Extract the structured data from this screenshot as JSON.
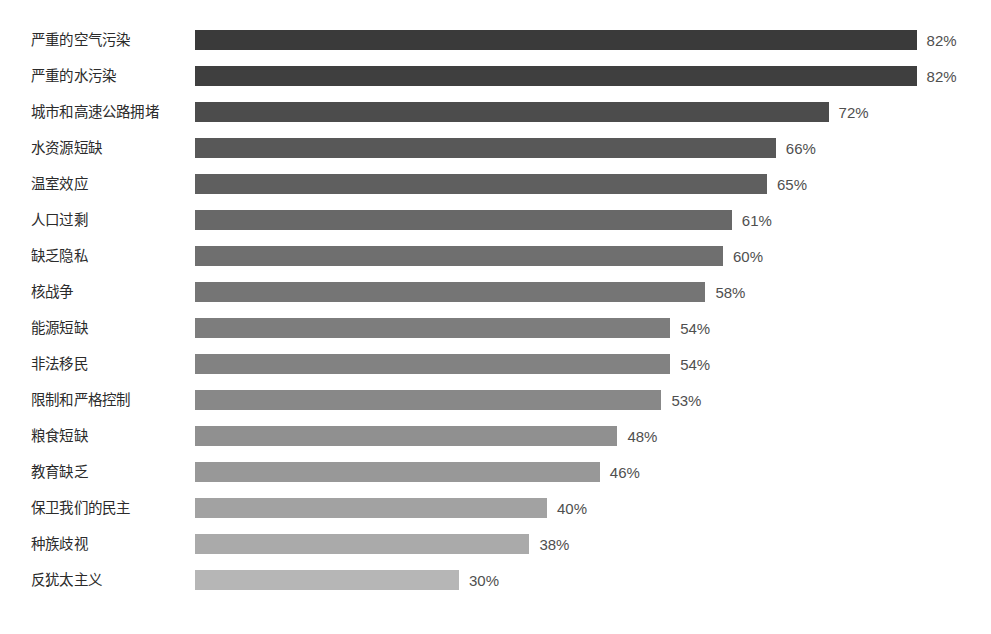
{
  "chart_data": {
    "type": "bar",
    "orientation": "horizontal",
    "title": "",
    "subtitle": "",
    "xlabel": "",
    "ylabel": "",
    "xlim": [
      0,
      90
    ],
    "grid": false,
    "legend": null,
    "value_suffix": "%",
    "categories": [
      "严重的空气污染",
      "严重的水污染",
      "城市和高速公路拥堵",
      "水资源短缺",
      "温室效应",
      "人口过剩",
      "缺乏隐私",
      "核战争",
      "能源短缺",
      "非法移民",
      "限制和严格控制",
      "粮食短缺",
      "教育缺乏",
      "保卫我们的民主",
      "种族歧视",
      "反犹太主义"
    ],
    "values": [
      82,
      82,
      72,
      66,
      65,
      61,
      60,
      58,
      54,
      54,
      53,
      48,
      46,
      40,
      38,
      30
    ],
    "value_labels": [
      "82%",
      "82%",
      "72%",
      "66%",
      "65%",
      "61%",
      "60%",
      "58%",
      "54%",
      "54%",
      "53%",
      "48%",
      "46%",
      "40%",
      "38%",
      "30%"
    ],
    "bar_colors": [
      "#3a3a3a",
      "#3f3f3f",
      "#4c4c4c",
      "#585858",
      "#5f5f5f",
      "#686868",
      "#6f6f6f",
      "#757575",
      "#7d7d7d",
      "#828282",
      "#888888",
      "#909090",
      "#989898",
      "#a2a2a2",
      "#aaaaaa",
      "#b6b6b6"
    ]
  },
  "style": {
    "background": "#ffffff",
    "label_color": "#2b2b2b",
    "value_color": "#4f4f4f"
  },
  "layout": {
    "bar_origin_x": 195,
    "px_per_percent": 8.8,
    "first_bar_top": 30,
    "row_pitch": 36,
    "bar_height": 20,
    "value_gap": 10
  }
}
